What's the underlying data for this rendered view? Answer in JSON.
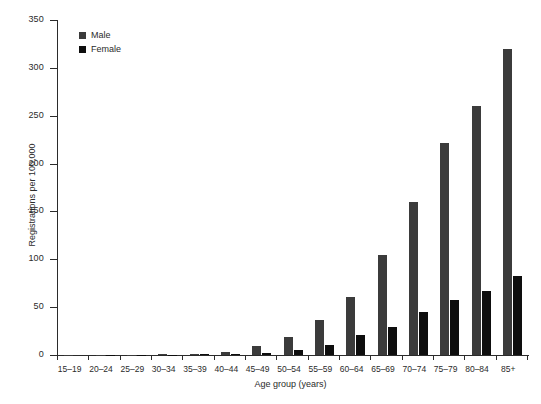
{
  "chart_data": {
    "type": "bar",
    "title": "",
    "xlabel": "Age group (years)",
    "ylabel": "Registrations per 100,000",
    "ylim": [
      0,
      350
    ],
    "yticks": [
      0,
      50,
      100,
      150,
      200,
      250,
      300,
      350
    ],
    "ytick_labels": [
      "0",
      "50",
      "100",
      "150",
      "200",
      "250",
      "300",
      "350"
    ],
    "grid": false,
    "legend_position": "upper-left",
    "categories": [
      "15–19",
      "20–24",
      "25–29",
      "30–34",
      "35–39",
      "40–44",
      "45–49",
      "50–54",
      "55–59",
      "60–64",
      "65–69",
      "70–74",
      "75–79",
      "80–84",
      "85+"
    ],
    "series": [
      {
        "name": "Male",
        "color": "#3b3b3b",
        "values": [
          0.1,
          0.2,
          0.4,
          1.0,
          1.5,
          3.5,
          9,
          19,
          37,
          61,
          105,
          160,
          222,
          260,
          320
        ]
      },
      {
        "name": "Female",
        "color": "#0e0e0e",
        "values": [
          0.05,
          0.1,
          0.2,
          0.4,
          0.6,
          1.2,
          2.5,
          5,
          10,
          21,
          29,
          45,
          57,
          67,
          83
        ]
      }
    ]
  },
  "legend": {
    "items": [
      {
        "label": "Male",
        "swatch": "male-swatch"
      },
      {
        "label": "Female",
        "swatch": "female-swatch"
      }
    ]
  }
}
